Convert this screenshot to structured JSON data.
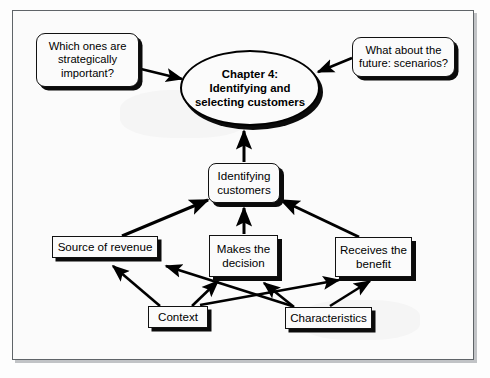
{
  "diagram": {
    "title_center": "Chapter 4:\nIdentifying and\nselecting customers",
    "center_line1": "Chapter 4:",
    "center_line2": "Identifying and",
    "center_line3": "selecting customers",
    "callout_left": "Which ones are\nstrategically\nimportant?",
    "callout_left_line1": "Which ones are",
    "callout_left_line2": "strategically",
    "callout_left_line3": "important?",
    "callout_right": "What about the\nfuture: scenarios?",
    "callout_right_line1": "What about the",
    "callout_right_line2": "future: scenarios?",
    "node_identifying_line1": "Identifying",
    "node_identifying_line2": "customers",
    "node_source_of_revenue": "Source of revenue",
    "node_makes_decision_line1": "Makes the",
    "node_makes_decision_line2": "decision",
    "node_receives_benefit_line1": "Receives the",
    "node_receives_benefit_line2": "benefit",
    "node_context": "Context",
    "node_characteristics": "Characteristics",
    "colors": {
      "line": "#000000",
      "frame_border": "#5f6468",
      "page_background": "#fdfdfd",
      "node_fill": "#fbfbfb",
      "shadow": "#0b0b0b"
    },
    "edges": [
      {
        "from": "callout_left",
        "to": "center_ellipse"
      },
      {
        "from": "callout_right",
        "to": "center_ellipse"
      },
      {
        "from": "identifying_customers",
        "to": "center_ellipse"
      },
      {
        "from": "source_of_revenue",
        "to": "identifying_customers"
      },
      {
        "from": "makes_the_decision",
        "to": "identifying_customers"
      },
      {
        "from": "receives_the_benefit",
        "to": "identifying_customers"
      },
      {
        "from": "context",
        "to": "source_of_revenue"
      },
      {
        "from": "context",
        "to": "makes_the_decision"
      },
      {
        "from": "context",
        "to": "receives_the_benefit"
      },
      {
        "from": "characteristics",
        "to": "source_of_revenue"
      },
      {
        "from": "characteristics",
        "to": "makes_the_decision"
      },
      {
        "from": "characteristics",
        "to": "receives_the_benefit"
      }
    ]
  }
}
